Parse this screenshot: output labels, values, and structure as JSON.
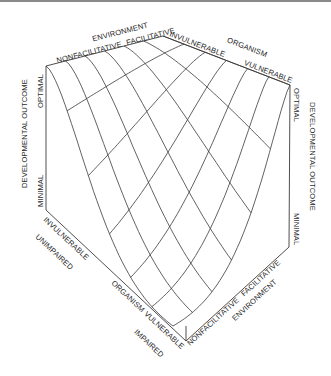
{
  "figure": {
    "type": "3d-surface-diagram",
    "title": "",
    "axes": {
      "environment": {
        "name": "ENVIRONMENT",
        "low": "NONFACILITATIVE",
        "high": "FACILITATIVE"
      },
      "organism": {
        "name": "ORGANISM",
        "low": "INVULNERABLE",
        "high": "VULNERABLE",
        "low_alt": "UNIMPAIRED",
        "high_alt": "IMPAIRED"
      },
      "outcome": {
        "name": "DEVELOPMENTAL OUTCOME",
        "high": "OPTIMAL",
        "low": "MINIMAL"
      }
    },
    "grid_divisions": {
      "environment": 6,
      "organism": 6
    },
    "colors": {
      "line": "#3a3a3a",
      "text": "#2a2a2a",
      "rule": "#8a8a8a"
    }
  },
  "labels": {
    "top_env_name": "ENVIRONMENT",
    "top_env_low": "NONFACILITATIVE",
    "top_env_high": "FACILITATIVE",
    "top_org_low": "INVULNERABLE",
    "top_org_name": "ORGANISM",
    "top_org_high": "VULNERABLE",
    "left_outcome_name": "DEVELOPMENTAL OUTCOME",
    "left_optimal": "OPTIMAL",
    "left_minimal": "MINIMAL",
    "right_outcome_name": "DEVELOPMENTAL OUTCOME",
    "right_optimal": "OPTIMAL",
    "right_minimal": "MINIMAL",
    "bottom_org_low": "INVULNERABLE",
    "bottom_unimpaired": "UNIMPAIRED",
    "bottom_org_name": "ORGANISM",
    "bottom_org_high": "VULNERABLE",
    "bottom_impaired": "IMPAIRED",
    "bottom_env_low": "NONFACILITATIVE",
    "bottom_env_high": "FACILITATIVE",
    "bottom_env_name": "ENVIRONMENT"
  }
}
